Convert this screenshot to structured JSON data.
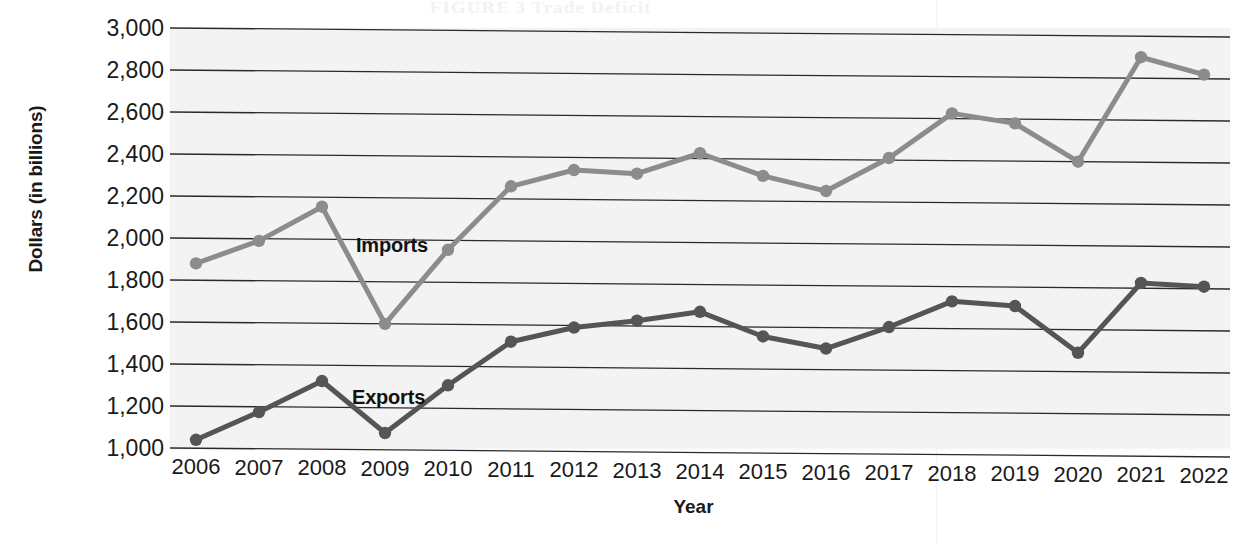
{
  "chart_data": {
    "type": "line",
    "title": "",
    "xlabel": "Year",
    "ylabel": "Dollars (in billions)",
    "categories": [
      "2006",
      "2007",
      "2008",
      "2009",
      "2010",
      "2011",
      "2012",
      "2013",
      "2014",
      "2015",
      "2016",
      "2017",
      "2018",
      "2019",
      "2020",
      "2021",
      "2022"
    ],
    "x": [
      2006,
      2007,
      2008,
      2009,
      2010,
      2011,
      2012,
      2013,
      2014,
      2015,
      2016,
      2017,
      2018,
      2019,
      2020,
      2021,
      2022
    ],
    "series": [
      {
        "name": "Imports",
        "color": "#8c8c8c",
        "values": [
          1880,
          1990,
          2155,
          1600,
          1955,
          2260,
          2340,
          2325,
          2425,
          2320,
          2250,
          2410,
          2625,
          2580,
          2400,
          2900,
          2820
        ]
      },
      {
        "name": "Exports",
        "color": "#555555",
        "values": [
          1040,
          1175,
          1325,
          1080,
          1310,
          1520,
          1590,
          1625,
          1670,
          1555,
          1500,
          1605,
          1730,
          1710,
          1490,
          1825,
          1810
        ]
      }
    ],
    "ylim": [
      1000,
      3000
    ],
    "ytick_values": [
      3000,
      2800,
      2600,
      2400,
      2200,
      2000,
      1800,
      1600,
      1400,
      1200,
      1000
    ],
    "ytick_labels": [
      "3,000",
      "2,800",
      "2,600",
      "2,400",
      "2,200",
      "2,000",
      "1,800",
      "1,600",
      "1,400",
      "1,200",
      "1,000"
    ],
    "grid": "horizontal",
    "legend_position": "inline-labels",
    "annotations": [
      {
        "text": "Imports",
        "series": "Imports"
      },
      {
        "text": "Exports",
        "series": "Exports"
      }
    ]
  },
  "axes": {
    "y_title": "Dollars (in billions)",
    "x_title": "Year"
  },
  "artifacts": {
    "ghost_line_1": "FIGURE 3 Trade Deficit",
    "ghost_line_2": "2006"
  },
  "colors": {
    "imports_line": "#8c8c8c",
    "exports_line": "#555555",
    "gridline": "#2a2a2a",
    "plot_background": "#f3f3f3",
    "page_background": "#ffffff",
    "text": "#1a1a1a"
  }
}
